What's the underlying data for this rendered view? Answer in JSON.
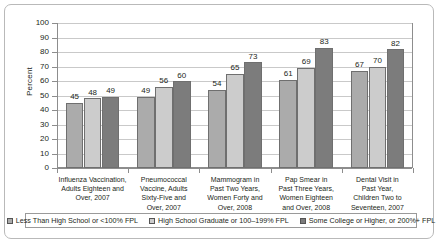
{
  "chart_data": {
    "type": "bar",
    "title": "",
    "xlabel": "",
    "ylabel": "Percent",
    "ylim": [
      0,
      100
    ],
    "ytick_step": 10,
    "yticks": [
      "100",
      "90",
      "80",
      "70",
      "60",
      "50",
      "40",
      "30",
      "20",
      "10",
      "0"
    ],
    "grid": true,
    "legend_position": "bottom",
    "categories": [
      "Influenza Vaccination, Adults Eighteen and Over, 2007",
      "Pneumococcal Vaccine, Adults Sixty-Five and Over, 2007",
      "Mammogram in Past Two Years, Women Forty and Over, 2008",
      "Pap Smear in Past Three Years, Women Eighteen and Over, 2008",
      "Dental Visit in Past Year, Children Two to Seventeen, 2007"
    ],
    "category_lines": [
      [
        "Influenza Vaccination,",
        "Adults Eighteen and",
        "Over, 2007"
      ],
      [
        "Pneumococcal",
        "Vaccine, Adults",
        "Sixty-Five and",
        "Over, 2007"
      ],
      [
        "Mammogram in",
        "Past Two Years,",
        "Women Forty and",
        "Over, 2008"
      ],
      [
        "Pap Smear in",
        "Past Three Years,",
        "Women Eighteen",
        "and Over, 2008"
      ],
      [
        "Dental Visit in",
        "Past Year,",
        "Children Two to",
        "Seventeen, 2007"
      ]
    ],
    "series": [
      {
        "name": "Less Than High School or <100% FPL",
        "color": "#ababab",
        "values": [
          45,
          49,
          54,
          61,
          67
        ]
      },
      {
        "name": "High School Graduate or 100–199% FPL",
        "color": "#cccccc",
        "values": [
          48,
          56,
          65,
          69,
          70
        ]
      },
      {
        "name": "Some College or Higher, or 200%+ FPL",
        "color": "#7c7c7c",
        "values": [
          49,
          60,
          73,
          83,
          82
        ]
      }
    ]
  }
}
